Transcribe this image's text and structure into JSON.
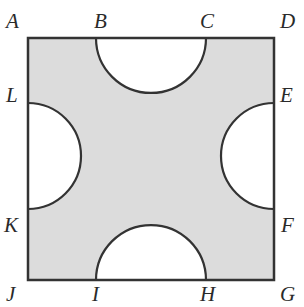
{
  "diagram": {
    "type": "geometry",
    "colors": {
      "shade": "#dcdcdc",
      "stroke": "#333333",
      "background": "#ffffff"
    },
    "labels": {
      "A": "A",
      "B": "B",
      "C": "C",
      "D": "D",
      "E": "E",
      "F": "F",
      "G": "G",
      "H": "H",
      "I": "I",
      "J": "J",
      "K": "K",
      "L": "L"
    },
    "semicircles": [
      {
        "diameter": "BC",
        "side": "top"
      },
      {
        "diameter": "EF",
        "side": "right"
      },
      {
        "diameter": "HI",
        "side": "bottom"
      },
      {
        "diameter": "KL",
        "side": "left"
      }
    ]
  }
}
